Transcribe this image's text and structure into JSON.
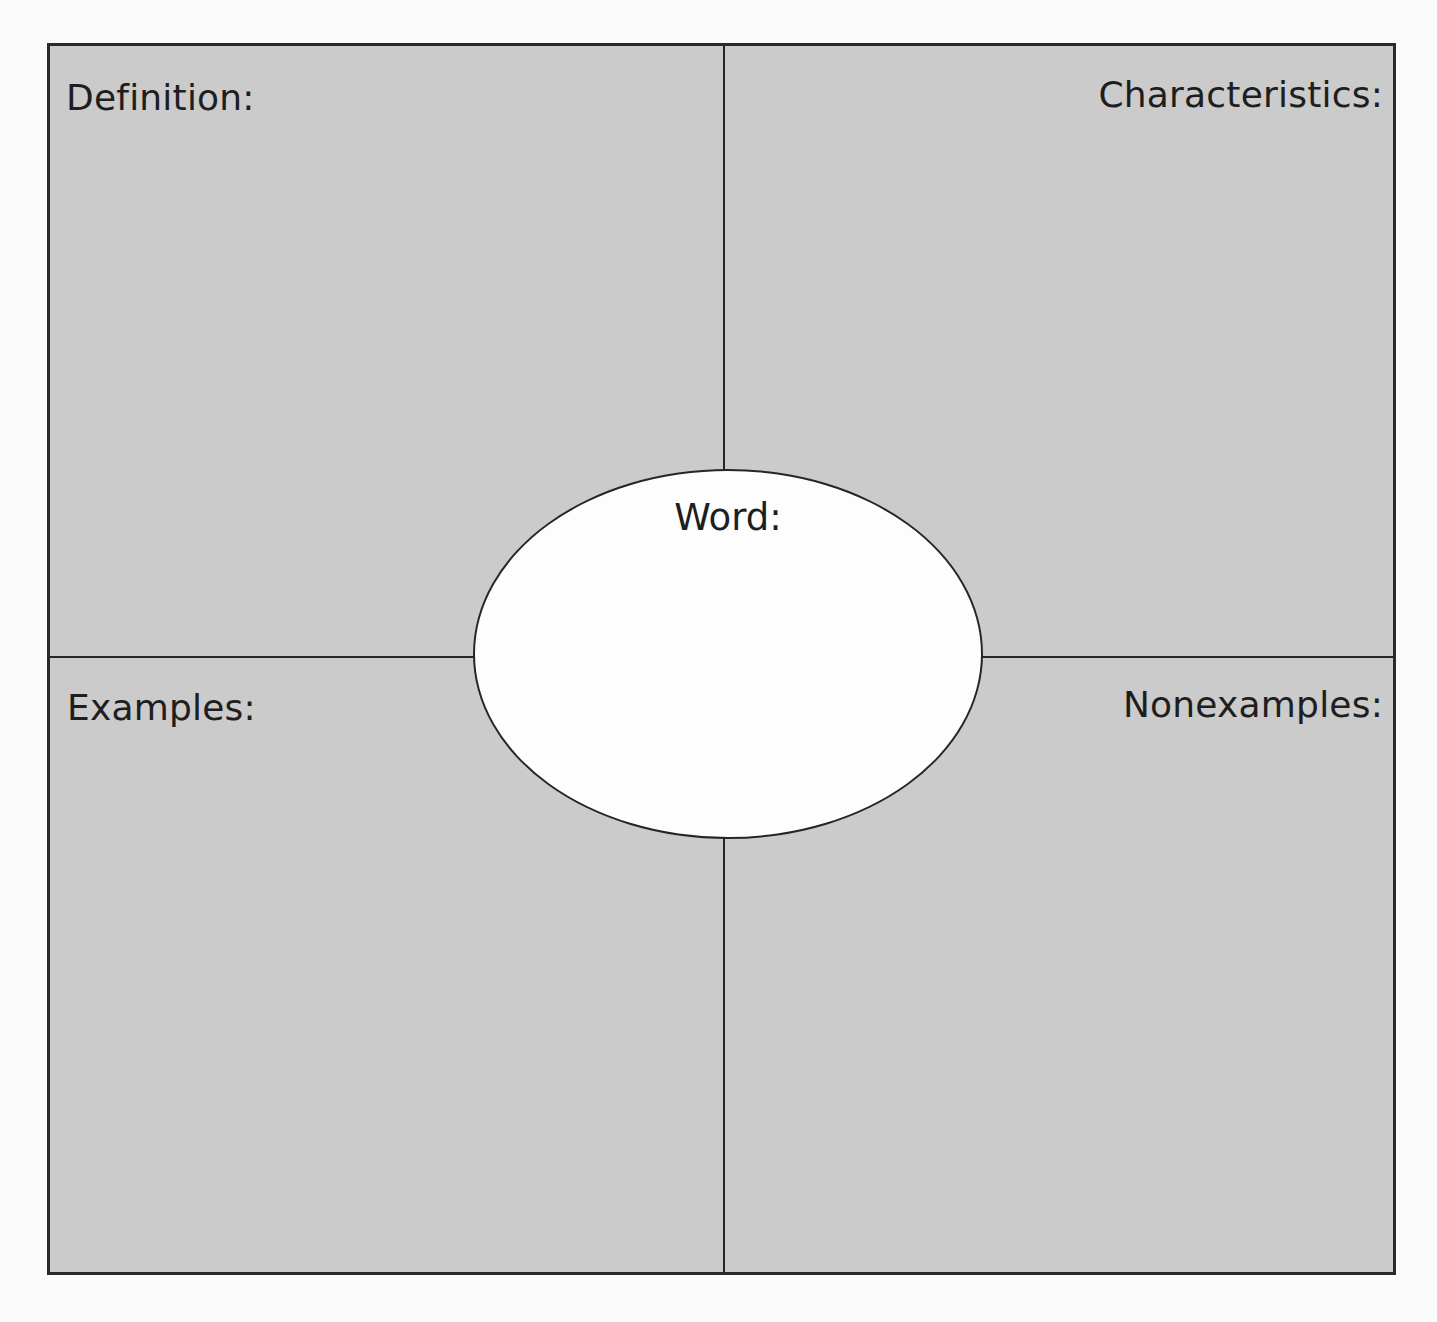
{
  "organizer": {
    "type": "Frayer model",
    "colors": {
      "page_background": "#fbfbfb",
      "quadrant_fill": "#cbcbcb",
      "oval_fill": "#fdfdfd",
      "line_color": "#262626",
      "text_color": "#1e1e1e"
    },
    "center": {
      "label": "Word:",
      "value": ""
    },
    "quadrants": [
      {
        "id": "definition",
        "label": "Definition:",
        "position": "top-left",
        "content": ""
      },
      {
        "id": "characteristics",
        "label": "Characteristics:",
        "position": "top-right",
        "content": ""
      },
      {
        "id": "examples",
        "label": "Examples:",
        "position": "bottom-left",
        "content": ""
      },
      {
        "id": "nonexamples",
        "label": "Nonexamples:",
        "position": "bottom-right",
        "content": ""
      }
    ]
  }
}
